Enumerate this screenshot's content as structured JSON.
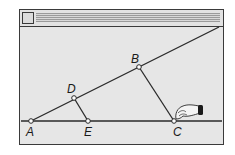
{
  "window": {
    "title": "",
    "close_box": "close-box"
  },
  "points": {
    "A": {
      "label": "A",
      "x": 31,
      "y": 121
    },
    "E": {
      "label": "E",
      "x": 88,
      "y": 121
    },
    "C": {
      "label": "C",
      "x": 174,
      "y": 121
    },
    "D": {
      "label": "D",
      "x": 74,
      "y": 98
    },
    "B": {
      "label": "B",
      "x": 139,
      "y": 67
    }
  },
  "cursor": {
    "icon": "hand-drag-icon"
  },
  "colors": {
    "line": "#2a2a2a",
    "window_bg": "#e6e6e6",
    "frame": "#3a3a3a"
  }
}
